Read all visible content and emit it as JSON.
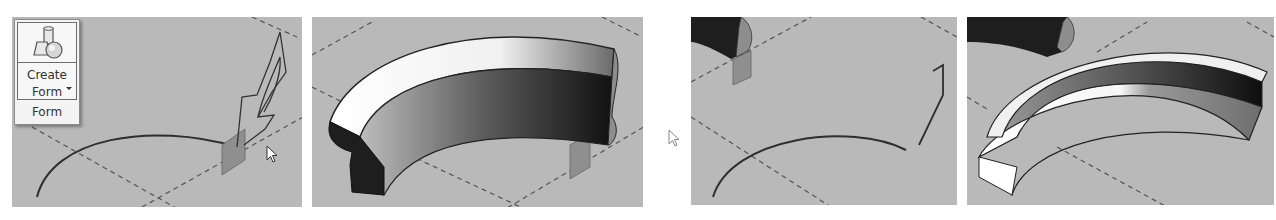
{
  "ribbon": {
    "button_label_line1": "Create",
    "button_label_line2": "Form",
    "panel_label": "Form",
    "icon": "create-form-icon"
  },
  "panels": [
    {
      "step": 1,
      "description": "Profile sketched on work plane at end of arc path",
      "cursor": "arrow-cursor"
    },
    {
      "step": 2,
      "description": "Swept form generated along arc path"
    },
    {
      "step": 3,
      "description": "Second arc path with L-shaped profile",
      "cursor": "arrow-cursor-outline"
    },
    {
      "step": 4,
      "description": "Rectangular-profile swept ring form"
    }
  ],
  "colors": {
    "viewport_bg": "#b9b9b9",
    "ribbon_bg": "#f4f4f4",
    "work_plane": "#8f8f8f",
    "line": "#3a3a3a"
  }
}
